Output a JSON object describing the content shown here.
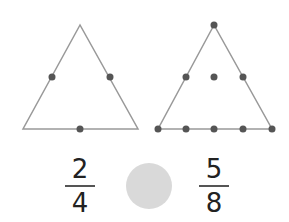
{
  "left_triangle": {
    "vertices": [
      [
        80,
        25
      ],
      [
        23,
        129
      ],
      [
        138,
        129
      ]
    ],
    "dots": [
      [
        52,
        77
      ],
      [
        110,
        77
      ],
      [
        80,
        129
      ]
    ],
    "dot_count": 3
  },
  "right_triangle": {
    "vertices": [
      [
        214,
        25
      ],
      [
        158,
        129
      ],
      [
        272,
        129
      ]
    ],
    "dots": [
      [
        214,
        25
      ],
      [
        186,
        77
      ],
      [
        214,
        77
      ],
      [
        243,
        77
      ],
      [
        158,
        129
      ],
      [
        186,
        129
      ],
      [
        214,
        129
      ],
      [
        243,
        129
      ],
      [
        272,
        129
      ]
    ],
    "dot_count": 9
  },
  "colors": {
    "line": "#999999",
    "dot": "#555555",
    "circle": "#d9d9d9",
    "text": "#222222"
  },
  "fraction_left": {
    "numerator": "2",
    "denominator": "4"
  },
  "fraction_right": {
    "numerator": "5",
    "denominator": "8"
  },
  "comparison_circle": {
    "cx": 149,
    "cy": 186,
    "r": 23,
    "content": ""
  }
}
